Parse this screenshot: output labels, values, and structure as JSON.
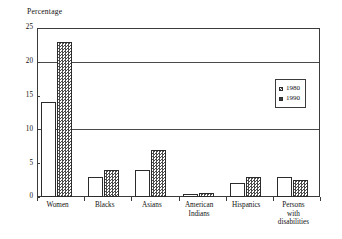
{
  "chart_data": {
    "type": "bar",
    "title": "",
    "ylabel": "Percentage",
    "xlabel": "",
    "ylim": [
      0,
      25
    ],
    "yticks": [
      0,
      5,
      10,
      15,
      20,
      25
    ],
    "ytick_labels": [
      "0",
      "5",
      "10",
      "15",
      "20",
      "25"
    ],
    "grid": true,
    "gridlines_at": [
      10,
      20
    ],
    "legend_position": "upper right",
    "categories": [
      "Women",
      "Blacks",
      "Asians",
      "American Indians",
      "Hispanics",
      "Persons with disabilities"
    ],
    "category_lines": [
      [
        "Women"
      ],
      [
        "Blacks"
      ],
      [
        "Asians"
      ],
      [
        "American",
        "Indians"
      ],
      [
        "Hispanics"
      ],
      [
        "Persons",
        "with",
        "disabilities"
      ]
    ],
    "series": [
      {
        "name": "1980",
        "values": [
          14,
          3,
          4,
          0.5,
          2,
          3
        ]
      },
      {
        "name": "1990",
        "values": [
          23,
          4,
          7,
          0.6,
          3,
          2.5
        ]
      }
    ]
  },
  "legend": {
    "items": [
      {
        "label": "1980",
        "series": "1980"
      },
      {
        "label": "1990",
        "series": "1990"
      }
    ]
  }
}
